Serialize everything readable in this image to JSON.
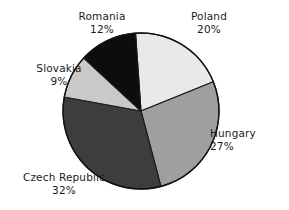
{
  "chart_data": {
    "type": "pie",
    "title": "",
    "subtitle": "",
    "xlabel": "",
    "ylabel": "",
    "legend_position": "none",
    "grid": false,
    "units": "percent",
    "total": 100,
    "categories": [
      "Poland",
      "Hungary",
      "Czech Republic",
      "Slovakia",
      "Romania"
    ],
    "values": [
      20,
      27,
      32,
      9,
      12
    ],
    "slices": [
      {
        "label": "Poland",
        "value": 20,
        "value_text": "20%",
        "color": "#e9e9e9",
        "start_angle": 0,
        "end_angle": 72,
        "label_position": "top-right"
      },
      {
        "label": "Hungary",
        "value": 27,
        "value_text": "27%",
        "color": "#9f9f9f",
        "start_angle": 72,
        "end_angle": 169.2,
        "label_position": "right"
      },
      {
        "label": "Czech Republic",
        "value": 32,
        "value_text": "32%",
        "color": "#3d3d3d",
        "start_angle": 169.2,
        "end_angle": 284.4,
        "label_position": "bottom-left"
      },
      {
        "label": "Slovakia",
        "value": 9,
        "value_text": "9%",
        "color": "#c9c9c9",
        "start_angle": 284.4,
        "end_angle": 316.8,
        "label_position": "left"
      },
      {
        "label": "Romania",
        "value": 12,
        "value_text": "12%",
        "color": "#0d0d0d",
        "start_angle": 316.8,
        "end_angle": 360,
        "label_position": "top-left"
      }
    ],
    "geometry": {
      "center_x": 141,
      "center_y": 111,
      "radius": 78,
      "rotation_deg": -4,
      "outline_color": "#111111"
    }
  },
  "labels": {
    "romania": {
      "name": "Romania",
      "value": "12%"
    },
    "poland": {
      "name": "Poland",
      "value": "20%"
    },
    "slovakia": {
      "name": "Slovakia",
      "value": "9%"
    },
    "hungary": {
      "name": "Hungary",
      "value": "27%"
    },
    "czech": {
      "name": "Czech Republic",
      "value": "32%"
    }
  }
}
